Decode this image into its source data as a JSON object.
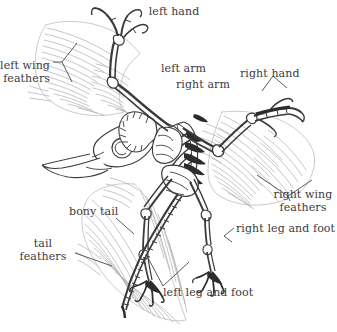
{
  "figure": {
    "background_color": "#ffffff",
    "bone_outline_color": "#3a3a3c",
    "bone_fill_color": "#ffffff",
    "feather_line_color": "#a9a9ad",
    "label_text_color": "#3b3b3f",
    "leader_line_color": "#4a4a4e"
  },
  "labels": {
    "left_hand": {
      "text": "left hand",
      "lines": [
        "left hand"
      ]
    },
    "left_wing_feathers": {
      "text": "left wing feathers",
      "lines": [
        "left wing",
        "feathers"
      ]
    },
    "left_arm": {
      "text": "left arm",
      "lines": [
        "left arm"
      ]
    },
    "right_arm": {
      "text": "right arm",
      "lines": [
        "right arm"
      ]
    },
    "right_hand": {
      "text": "right hand",
      "lines": [
        "right hand"
      ]
    },
    "right_wing_feathers": {
      "text": "right wing feathers",
      "lines": [
        "right wing",
        "feathers"
      ]
    },
    "right_leg_and_foot": {
      "text": "right leg and foot",
      "lines": [
        "right leg and foot"
      ]
    },
    "bony_tail": {
      "text": "bony tail",
      "lines": [
        "bony tail"
      ]
    },
    "tail_feathers": {
      "text": "tail feathers",
      "lines": [
        "tail",
        "feathers"
      ]
    },
    "left_leg_and_foot": {
      "text": "left leg and foot",
      "lines": [
        "left leg and foot"
      ]
    }
  }
}
